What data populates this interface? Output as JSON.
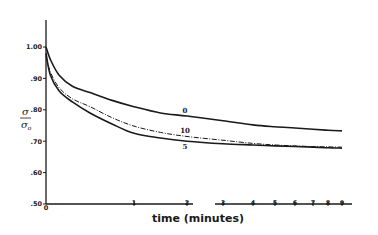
{
  "chart_data": {
    "type": "line",
    "title": "",
    "xlabel": "time (minutes)",
    "ylabel": "σ/σ₀",
    "ylim": [
      0.5,
      1.05
    ],
    "xlim": [
      0,
      9
    ],
    "x_scale": "non-linear (compressed beyond 2, axis break between 2 and 3)",
    "grid": false,
    "legend": "inline curve labels",
    "x_ticks": [
      0,
      1,
      2,
      3,
      4,
      5,
      6,
      7,
      8,
      9
    ],
    "x_tick_labels": [
      "0",
      "1",
      "2",
      "3",
      "4",
      "5",
      "6",
      "7",
      "8",
      "9"
    ],
    "y_ticks": [
      0.5,
      0.6,
      0.7,
      0.8,
      0.9,
      1.0
    ],
    "y_tick_labels": [
      ".50",
      ".60",
      ".70",
      ".80",
      ".90",
      "1.00"
    ],
    "series": [
      {
        "name": "0",
        "style": "solid",
        "x": [
          0,
          0.05,
          0.15,
          0.3,
          0.5,
          0.75,
          1,
          1.5,
          2,
          3,
          4,
          5,
          6,
          7,
          8,
          9
        ],
        "values": [
          1.0,
          0.96,
          0.91,
          0.875,
          0.855,
          0.83,
          0.81,
          0.79,
          0.78,
          0.765,
          0.752,
          0.746,
          0.742,
          0.738,
          0.735,
          0.733
        ]
      },
      {
        "name": "10",
        "style": "dash-dot",
        "x": [
          0,
          0.05,
          0.15,
          0.3,
          0.5,
          0.75,
          1,
          1.5,
          2,
          3,
          4,
          5,
          6,
          7,
          8,
          9
        ],
        "values": [
          0.97,
          0.92,
          0.87,
          0.835,
          0.81,
          0.775,
          0.748,
          0.728,
          0.715,
          0.703,
          0.693,
          0.688,
          0.685,
          0.683,
          0.682,
          0.681
        ]
      },
      {
        "name": "5",
        "style": "solid",
        "x": [
          0,
          0.05,
          0.15,
          0.3,
          0.5,
          0.75,
          1,
          1.5,
          2,
          3,
          4,
          5,
          6,
          7,
          8,
          9
        ],
        "values": [
          0.98,
          0.91,
          0.86,
          0.825,
          0.79,
          0.755,
          0.725,
          0.71,
          0.7,
          0.692,
          0.688,
          0.685,
          0.683,
          0.681,
          0.679,
          0.678
        ]
      }
    ],
    "annotations": [
      {
        "text": "0",
        "series": "0",
        "at_x": 2,
        "position": "above"
      },
      {
        "text": "10",
        "series": "10",
        "at_x": 2,
        "position": "above"
      },
      {
        "text": "5",
        "series": "5",
        "at_x": 2,
        "position": "below"
      }
    ]
  },
  "layout": {
    "x_tick_px": [
      46,
      134,
      187,
      223,
      253,
      275,
      295,
      313,
      328,
      342
    ],
    "y_px_top": 47,
    "y_px_per_unit": 314,
    "axis_left": 46,
    "axis_bottom": 204,
    "axis_right": 352,
    "axis_top": 20,
    "axis_break_x": [
      193,
      215
    ]
  }
}
